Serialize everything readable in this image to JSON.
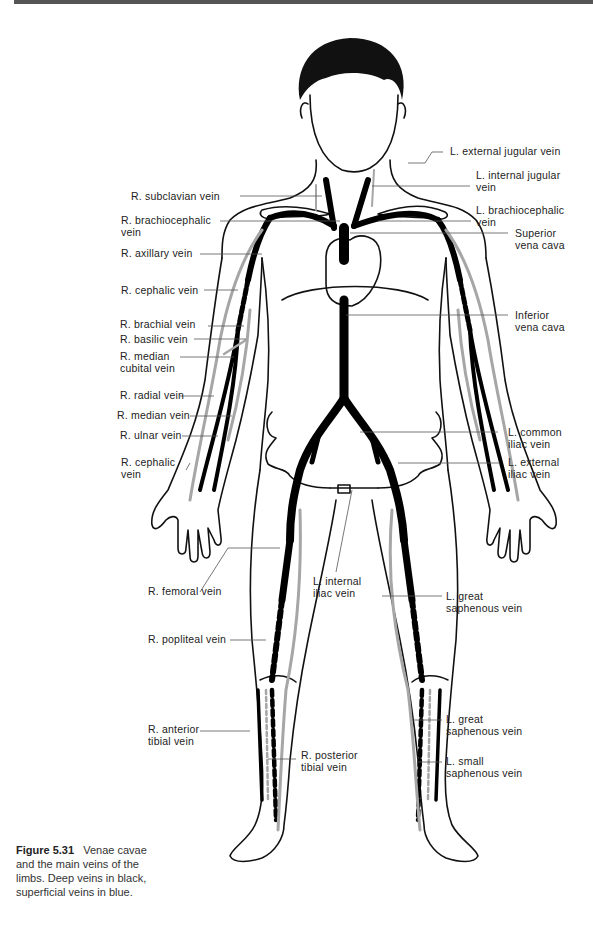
{
  "figure": {
    "number": "Figure 5.31",
    "caption": "Venae cavae and the main veins of the limbs. Deep veins in black, superficial veins in blue."
  },
  "colors": {
    "deep_vein": "#000000",
    "superficial_vein": "#a6a6a6",
    "outline": "#111111",
    "leader_line": "#555555",
    "top_bar": "#555555"
  },
  "legend": {
    "deep": "Deep veins in black",
    "superficial": "superficial veins in blue"
  },
  "labels": {
    "left": [
      {
        "id": "r-subclavian",
        "text": "R. subclavian  vein"
      },
      {
        "id": "r-brachiocephalic",
        "text": "R. brachiocephalic\nvein"
      },
      {
        "id": "r-axillary",
        "text": "R. axillary vein"
      },
      {
        "id": "r-cephalic-upper",
        "text": "R. cephalic vein"
      },
      {
        "id": "r-brachial",
        "text": "R. brachial vein"
      },
      {
        "id": "r-basilic",
        "text": "R. basilic vein"
      },
      {
        "id": "r-median-cubital",
        "text": "R. median\ncubital vein"
      },
      {
        "id": "r-radial",
        "text": "R. radial vein"
      },
      {
        "id": "r-median",
        "text": "R. median vein"
      },
      {
        "id": "r-ulnar",
        "text": "R. ulnar vein"
      },
      {
        "id": "r-cephalic-lower",
        "text": "R. cephalic\nvein"
      },
      {
        "id": "r-femoral",
        "text": "R. femoral  vein"
      },
      {
        "id": "r-popliteal",
        "text": "R. popliteal vein"
      },
      {
        "id": "r-anterior-tibial",
        "text": "R. anterior\ntibial vein"
      },
      {
        "id": "r-posterior-tibial",
        "text": "R. posterior\ntibial vein"
      }
    ],
    "right": [
      {
        "id": "l-external-jugular",
        "text": "L. external  jugular vein"
      },
      {
        "id": "l-internal-jugular",
        "text": "L. internal  jugular\nvein"
      },
      {
        "id": "l-brachiocephalic",
        "text": "L. brachiocephalic\nvein"
      },
      {
        "id": "superior-vena-cava",
        "text": "Superior\nvena cava"
      },
      {
        "id": "inferior-vena-cava",
        "text": "Inferior\nvena cava"
      },
      {
        "id": "l-common-iliac",
        "text": "L. common\niliac vein"
      },
      {
        "id": "l-external-iliac",
        "text": "L. external\niliac vein"
      },
      {
        "id": "l-internal-iliac",
        "text": "L. internal\niliac vein"
      },
      {
        "id": "l-great-saphenous-thigh",
        "text": "L. great\nsaphenous vein"
      },
      {
        "id": "l-great-saphenous-leg",
        "text": "L. great\nsaphenous vein"
      },
      {
        "id": "l-small-saphenous",
        "text": "L. small\nsaphenous vein"
      }
    ]
  }
}
